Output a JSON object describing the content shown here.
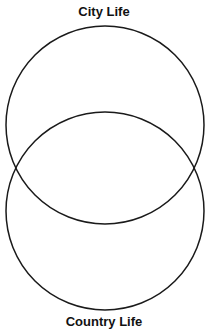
{
  "diagram": {
    "type": "venn",
    "sets": [
      {
        "label": "City Life",
        "position": "top"
      },
      {
        "label": "Country Life",
        "position": "bottom"
      }
    ],
    "stroke_color": "#1a1a1a",
    "background": "#ffffff"
  }
}
